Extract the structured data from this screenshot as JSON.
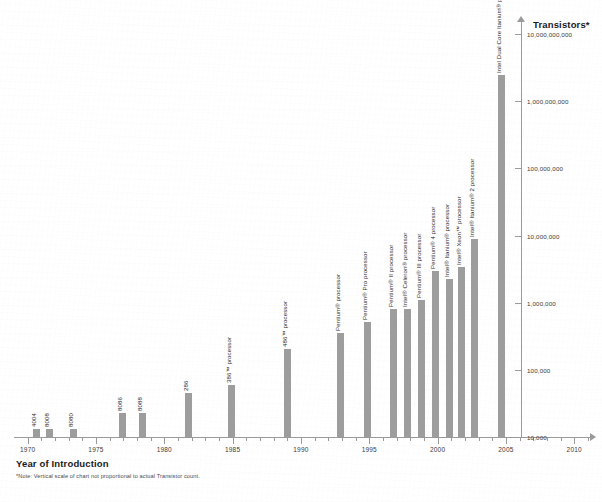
{
  "chart_data": {
    "type": "bar",
    "title": "",
    "xlabel": "Year of Introduction",
    "ylabel": "Transistors*",
    "footnote": "*Note: Vertical scale of chart not proportional to actual Transistor count.",
    "grid": false,
    "legend": "none",
    "xlim": [
      1969,
      2011
    ],
    "x_major_ticks": [
      "1970",
      "1975",
      "1980",
      "1985",
      "1990",
      "1995",
      "2000",
      "2005",
      "2010"
    ],
    "x_minor_tick_interval": 1,
    "yscale": "log",
    "ylim": [
      10000,
      20000000000
    ],
    "y_tick_labels": [
      "10,000",
      "100,000",
      "1,000,000",
      "10,000,000",
      "100,000,000",
      "1,000,000,000",
      "10,000,000,000"
    ],
    "bar_color": "#9d9d9d",
    "categories": [
      "4004",
      "8008",
      "8080",
      "8086",
      "8088",
      "286",
      "386™ processor",
      "486™ processor",
      "Pentium® processor",
      "Pentium® Pro processor",
      "Pentium® II processor",
      "Intel® Celeron® processor",
      "Pentium® III processor",
      "Pentium® 4 processor",
      "Intel® Itanium® processor",
      "Intel® Xeon™ processor",
      "Intel® Itanium® 2 processor",
      "Intel Dual Core Itanium® processor"
    ],
    "x": [
      1971,
      1972,
      1974,
      1978,
      1979,
      1982,
      1985,
      1989,
      1993,
      1995,
      1997,
      1998,
      1999,
      2000,
      2001,
      2002,
      2003,
      2005
    ],
    "values": [
      2300,
      3500,
      6000,
      29000,
      29000,
      134000,
      275000,
      1200000,
      3100000,
      5500000,
      7500000,
      7500000,
      9500000,
      42000000,
      25000000,
      25000000,
      220000000,
      1720000000
    ],
    "bars": [
      {
        "label": "4004",
        "year": 1971,
        "value": 2300,
        "left": 33,
        "height": 8
      },
      {
        "label": "8008",
        "year": 1972,
        "value": 3500,
        "left": 46,
        "height": 8
      },
      {
        "label": "8080",
        "year": 1974,
        "value": 6000,
        "left": 70,
        "height": 8
      },
      {
        "label": "8086",
        "year": 1978,
        "value": 29000,
        "left": 119,
        "height": 24
      },
      {
        "label": "8088",
        "year": 1979,
        "value": 29000,
        "left": 139,
        "height": 24
      },
      {
        "label": "286",
        "year": 1982,
        "value": 134000,
        "left": 185,
        "height": 44
      },
      {
        "label": "386™ processor",
        "year": 1985,
        "value": 275000,
        "left": 228,
        "height": 52
      },
      {
        "label": "486™ processor",
        "year": 1989,
        "value": 1200000,
        "left": 284,
        "height": 88
      },
      {
        "label": "Pentium® processor",
        "year": 1993,
        "value": 3100000,
        "left": 337,
        "height": 104
      },
      {
        "label": "Pentium® Pro processor",
        "year": 1995,
        "value": 5500000,
        "left": 364,
        "height": 115
      },
      {
        "label": "Pentium® II processor",
        "year": 1997,
        "value": 7500000,
        "left": 390,
        "height": 128
      },
      {
        "label": "Intel® Celeron® processor",
        "year": 1998,
        "value": 7500000,
        "left": 404,
        "height": 128
      },
      {
        "label": "Pentium® III processor",
        "year": 1999,
        "value": 9500000,
        "left": 418,
        "height": 137
      },
      {
        "label": "Pentium® 4 processor",
        "year": 2000,
        "value": 42000000,
        "left": 432,
        "height": 166
      },
      {
        "label": "Intel® Itanium® processor",
        "year": 2001,
        "value": 25000000,
        "left": 446,
        "height": 158
      },
      {
        "label": "Intel® Xeon™ processor",
        "year": 2002,
        "value": 25000000,
        "left": 458,
        "height": 170
      },
      {
        "label": "Intel® Itanium® 2 processor",
        "year": 2003,
        "value": 220000000,
        "left": 471,
        "height": 198
      },
      {
        "label": "Intel Dual Core Itanium® processor",
        "year": 2005,
        "value": 1720000000,
        "left": 498,
        "height": 362
      }
    ]
  },
  "axes": {
    "y_title": "Transistors*",
    "x_title": "Year of Introduction"
  },
  "footnote": "*Note: Vertical scale of chart not proportional to actual Transistor count."
}
